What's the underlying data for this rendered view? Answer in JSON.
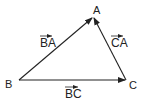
{
  "diagram": {
    "vertices": [
      {
        "id": "A",
        "label": "A",
        "x": 93,
        "y": 17,
        "lx": 93,
        "ly": 14
      },
      {
        "id": "B",
        "label": "B",
        "x": 19,
        "y": 80,
        "lx": 6,
        "ly": 88
      },
      {
        "id": "C",
        "label": "C",
        "x": 126,
        "y": 80,
        "lx": 129,
        "ly": 89
      }
    ],
    "vectors": [
      {
        "name": "BA",
        "label": "BA",
        "from": "B",
        "to": "A",
        "label_x": 41,
        "label_y": 48
      },
      {
        "name": "CA",
        "label": "CA",
        "from": "C",
        "to": "A",
        "label_x": 111,
        "label_y": 48
      },
      {
        "name": "BC",
        "label": "BC",
        "from": "B",
        "to": "C",
        "label_x": 65,
        "label_y": 100
      }
    ],
    "colors": {
      "stroke": "#222222",
      "text": "#222222",
      "background": "#ffffff"
    }
  }
}
